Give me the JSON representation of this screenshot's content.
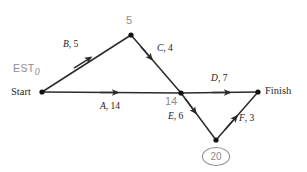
{
  "diagram": {
    "kind": "activity-on-arrow-network",
    "colors": {
      "line": "#2b2b2b",
      "node": "#111111",
      "activity_text": "#1a1a1a",
      "event_text": "#8c8c8c",
      "background": "#ffffff"
    },
    "terminals": {
      "start_label": "Start",
      "finish_label": "Finish"
    },
    "est_tag": {
      "text": "EST",
      "value": "0"
    },
    "events": [
      {
        "id": "start",
        "time": "0",
        "x": 42,
        "y": 92
      },
      {
        "id": "top",
        "time": "5",
        "x": 131,
        "y": 35
      },
      {
        "id": "middle",
        "time": "14",
        "x": 181,
        "y": 93
      },
      {
        "id": "bottom",
        "time": "20",
        "x": 216,
        "y": 140,
        "circled": true
      },
      {
        "id": "finish",
        "time": "",
        "x": 258,
        "y": 92
      }
    ],
    "activities": [
      {
        "id": "B",
        "letter": "B",
        "separator": ", ",
        "duration": "5",
        "label": "B, 5",
        "from": "start",
        "to": "top"
      },
      {
        "id": "C",
        "letter": "C",
        "separator": ", ",
        "duration": "4",
        "label": "C, 4",
        "from": "top",
        "to": "middle"
      },
      {
        "id": "A",
        "letter": "A",
        "separator": ", ",
        "duration": "14",
        "label": "A, 14",
        "from": "start",
        "to": "middle"
      },
      {
        "id": "D",
        "letter": "D",
        "separator": ", ",
        "duration": "7",
        "label": "D, 7",
        "from": "middle",
        "to": "finish"
      },
      {
        "id": "E",
        "letter": "E",
        "separator": ", ",
        "duration": "6",
        "label": "E, 6",
        "from": "middle",
        "to": "bottom"
      },
      {
        "id": "F",
        "letter": "F",
        "separator": ", ",
        "duration": "3",
        "label": "F, 3",
        "from": "bottom",
        "to": "finish"
      }
    ]
  }
}
